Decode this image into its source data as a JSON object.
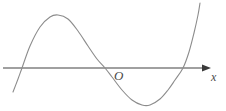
{
  "figure": {
    "background_color": "#ffffff",
    "width": 226,
    "height": 111,
    "labels": {
      "origin": "O",
      "x_axis": "x"
    },
    "colors": {
      "curve": "#8c8c8c",
      "axis": "#808080",
      "label": "#4a4a4a"
    }
  },
  "chart_data": {
    "type": "line",
    "title": "",
    "subtitle": "",
    "xlabel": "x",
    "ylabel": "",
    "grid": false,
    "legend": null,
    "axes": {
      "x_axis": {
        "visible": true,
        "pixel_y": 68,
        "pixel_x_start": 3,
        "pixel_x_end": 210,
        "arrow_at_end": true,
        "label": "x"
      },
      "y_axis": {
        "visible": false
      },
      "origin_marker": {
        "label": "O",
        "pixel_x": 105,
        "pixel_y": 68
      }
    },
    "series": [
      {
        "name": "cubic curve",
        "color": "#8c8c8c",
        "points_pixel": [
          [
            13,
            92
          ],
          [
            18,
            79
          ],
          [
            22,
            68
          ],
          [
            30,
            46
          ],
          [
            40,
            27
          ],
          [
            50,
            17
          ],
          [
            58,
            15
          ],
          [
            68,
            19
          ],
          [
            78,
            31
          ],
          [
            88,
            46
          ],
          [
            97,
            59
          ],
          [
            105,
            68
          ],
          [
            112,
            77
          ],
          [
            122,
            90
          ],
          [
            132,
            100
          ],
          [
            142,
            105
          ],
          [
            150,
            105
          ],
          [
            160,
            99
          ],
          [
            168,
            90
          ],
          [
            175,
            80
          ],
          [
            183,
            68
          ],
          [
            189,
            52
          ],
          [
            194,
            33
          ],
          [
            198,
            15
          ],
          [
            200,
            3
          ]
        ],
        "x_intercepts_pixel": [
          22,
          105,
          183
        ],
        "local_maximum_pixel": [
          58,
          15
        ],
        "local_minimum_pixel": [
          145,
          105
        ]
      }
    ],
    "annotations": [
      {
        "text": "O",
        "pixel_x": 114,
        "pixel_y": 69,
        "style": "italic-serif"
      },
      {
        "text": "x",
        "pixel_x": 211,
        "pixel_y": 71,
        "style": "italic-serif"
      }
    ]
  }
}
